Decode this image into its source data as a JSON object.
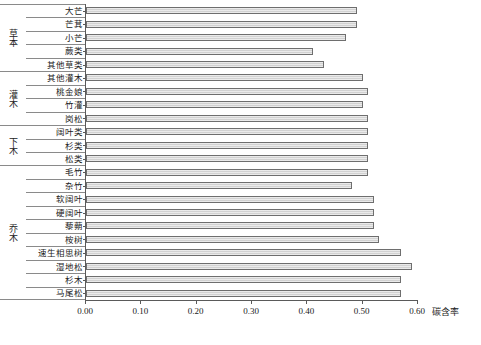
{
  "chart_data": {
    "type": "bar",
    "orientation": "horizontal",
    "title": "",
    "xlabel": "碳含率",
    "ylabel": "",
    "xlim": [
      0.0,
      0.6
    ],
    "xticks": [
      "0.00",
      "0.10",
      "0.20",
      "0.30",
      "0.40",
      "0.50",
      "0.60"
    ],
    "xtick_values": [
      0.0,
      0.1,
      0.2,
      0.3,
      0.4,
      0.5,
      0.6
    ],
    "grid": false,
    "legend": false,
    "bar_color": "#d2d2d2",
    "bar_border_color": "#6e6e6e",
    "axis_color": "#5a5a5a",
    "categories": [
      "大芒",
      "芒萁",
      "小芒",
      "蕨类",
      "其他草类",
      "其他灌木",
      "桃金娘",
      "竹灌",
      "岗松",
      "阔叶类",
      "杉类",
      "松类",
      "毛竹",
      "杂竹",
      "软阔叶",
      "硬阔叶",
      "藜蒴",
      "桉树",
      "速生相思树",
      "湿地松",
      "杉木",
      "马尾松"
    ],
    "values": [
      0.49,
      0.49,
      0.47,
      0.41,
      0.43,
      0.5,
      0.51,
      0.5,
      0.51,
      0.51,
      0.51,
      0.51,
      0.51,
      0.48,
      0.52,
      0.52,
      0.52,
      0.53,
      0.57,
      0.59,
      0.57,
      0.57
    ],
    "groups": [
      {
        "label": "草本",
        "start": 0,
        "count": 5
      },
      {
        "label": "灌木",
        "start": 5,
        "count": 4
      },
      {
        "label": "下木",
        "start": 9,
        "count": 3
      },
      {
        "label": "乔木",
        "start": 12,
        "count": 10
      }
    ]
  }
}
